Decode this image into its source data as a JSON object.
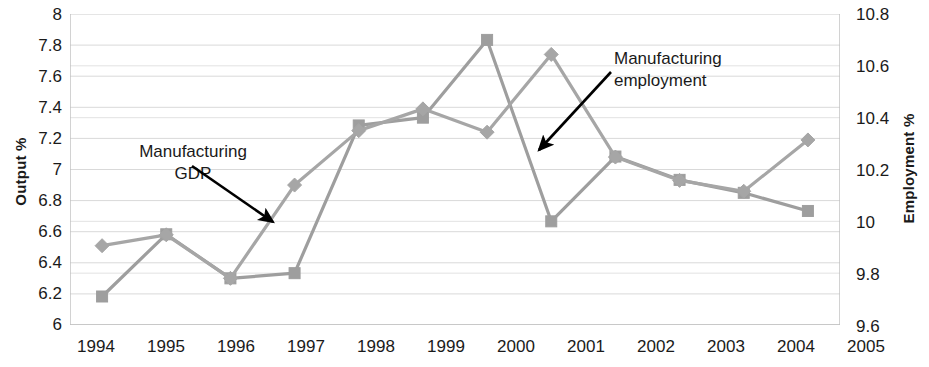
{
  "axes": {
    "left_title": "Output %",
    "right_title": "Employment %",
    "left_ticks": [
      "8",
      "7.8",
      "7.6",
      "7.4",
      "7.2",
      "7",
      "6.8",
      "6.6",
      "6.4",
      "6.2",
      "6"
    ],
    "right_ticks": [
      "10.8",
      "10.6",
      "10.4",
      "10.2",
      "10",
      "9.8",
      "9.6"
    ],
    "x_ticks": [
      "1994",
      "1995",
      "1996",
      "1997",
      "1998",
      "1999",
      "2000",
      "2001",
      "2002",
      "2003",
      "2004",
      "2005"
    ]
  },
  "annotations": {
    "gdp_line1": "Manufacturing",
    "gdp_line2": "GDP",
    "employment_line1": "Manufacturing",
    "employment_line2": "employment"
  },
  "colors": {
    "series_gdp": "#a6a6a6",
    "series_employment": "#9e9e9e",
    "gridline": "#d9d9d9",
    "axis": "#bfbfbf",
    "annotation_arrow": "#000000",
    "text": "#1a1a1a"
  },
  "chart_data": {
    "type": "line",
    "title": "",
    "xlabel": "",
    "ylabel": "Output %",
    "y2label": "Employment %",
    "grid": true,
    "legend": "annotations",
    "categories": [
      "1994",
      "1995",
      "1996",
      "1997",
      "1998",
      "1999",
      "2000",
      "2001",
      "2002",
      "2003",
      "2004",
      "2005"
    ],
    "ylim": [
      6,
      8
    ],
    "y2lim": [
      9.6,
      10.8
    ],
    "series": [
      {
        "name": "Manufacturing GDP",
        "axis": "left",
        "marker": "diamond",
        "values": [
          6.51,
          6.58,
          6.3,
          6.9,
          7.25,
          7.39,
          7.24,
          7.74,
          7.08,
          6.93,
          6.86,
          7.19
        ]
      },
      {
        "name": "Manufacturing employment",
        "axis": "right",
        "marker": "square",
        "values": [
          9.71,
          9.95,
          9.78,
          9.8,
          10.37,
          10.4,
          10.7,
          10.0,
          10.25,
          10.16,
          10.11,
          10.04
        ]
      }
    ]
  }
}
